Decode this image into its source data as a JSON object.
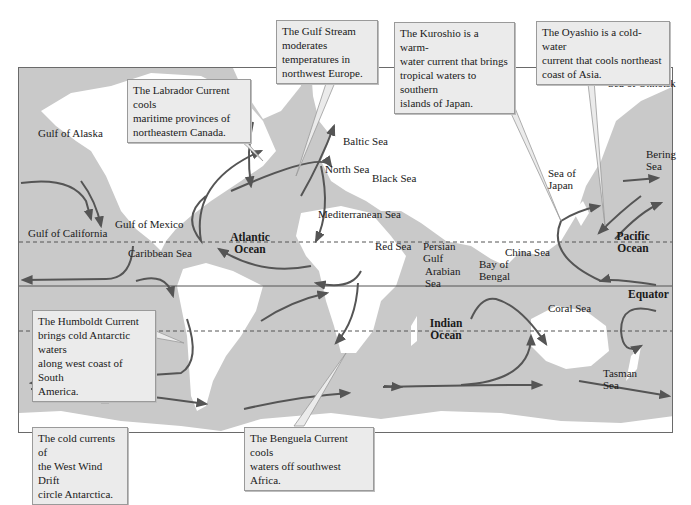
{
  "map": {
    "title": "World Ocean Currents",
    "colors": {
      "ocean": "#c9c9c9",
      "land": "#ffffff",
      "current_arrow": "#555555",
      "callout_bg": "#ebebeb",
      "frame": "#6a6a6a"
    },
    "reference_lines": {
      "equator": "Equator"
    },
    "oceans": {
      "atlantic": {
        "line1": "Atlantic",
        "line2": "Ocean"
      },
      "pacific": {
        "line1": "Pacific",
        "line2": "Ocean"
      },
      "indian": {
        "line1": "Indian",
        "line2": "Ocean"
      }
    },
    "seas": {
      "gulf_of_alaska": "Gulf of Alaska",
      "gulf_of_mexico": "Gulf of Mexico",
      "gulf_of_california": "Gulf of California",
      "caribbean_sea": "Caribbean Sea",
      "baltic_sea": "Baltic Sea",
      "north_sea": "North Sea",
      "black_sea": "Black Sea",
      "mediterranean_sea": "Mediterranean Sea",
      "red_sea": "Red Sea",
      "persian_gulf": {
        "line1": "Persian",
        "line2": "Gulf"
      },
      "arabian_sea": {
        "line1": "Arabian",
        "line2": "Sea"
      },
      "bay_of_bengal": {
        "line1": "Bay of",
        "line2": "Bengal"
      },
      "china_sea": "China Sea",
      "sea_of_japan": {
        "line1": "Sea of",
        "line2": "Japan"
      },
      "sea_of_okhotsk": "Sea of Okhotsk",
      "bering_sea": {
        "line1": "Bering",
        "line2": "Sea"
      },
      "coral_sea": "Coral Sea",
      "tasman_sea": {
        "line1": "Tasman",
        "line2": "Sea"
      }
    },
    "callouts": {
      "gulf_stream": {
        "line1": "The Gulf Stream",
        "line2": "moderates",
        "line3": "temperatures in",
        "line4": "northwest Europe."
      },
      "labrador": {
        "line1": "The Labrador Current cools",
        "line2": "maritime provinces of",
        "line3": "northeastern Canada."
      },
      "kuroshio": {
        "line1": "The Kuroshio is a warm-",
        "line2": "water current that brings",
        "line3": "tropical waters to southern",
        "line4": "islands of Japan."
      },
      "oyashio": {
        "line1": "The Oyashio is a cold-water",
        "line2": "current that cools northeast",
        "line3": "coast of Asia."
      },
      "humboldt": {
        "line1": "The Humboldt Current",
        "line2": "brings cold Antarctic waters",
        "line3": "along west coast of South",
        "line4": "America."
      },
      "west_wind_drift": {
        "line1": "The cold currents of",
        "line2": "the West Wind Drift",
        "line3": "circle Antarctica."
      },
      "benguela": {
        "line1": "The Benguela Current cools",
        "line2": "waters off southwest Africa."
      }
    }
  }
}
